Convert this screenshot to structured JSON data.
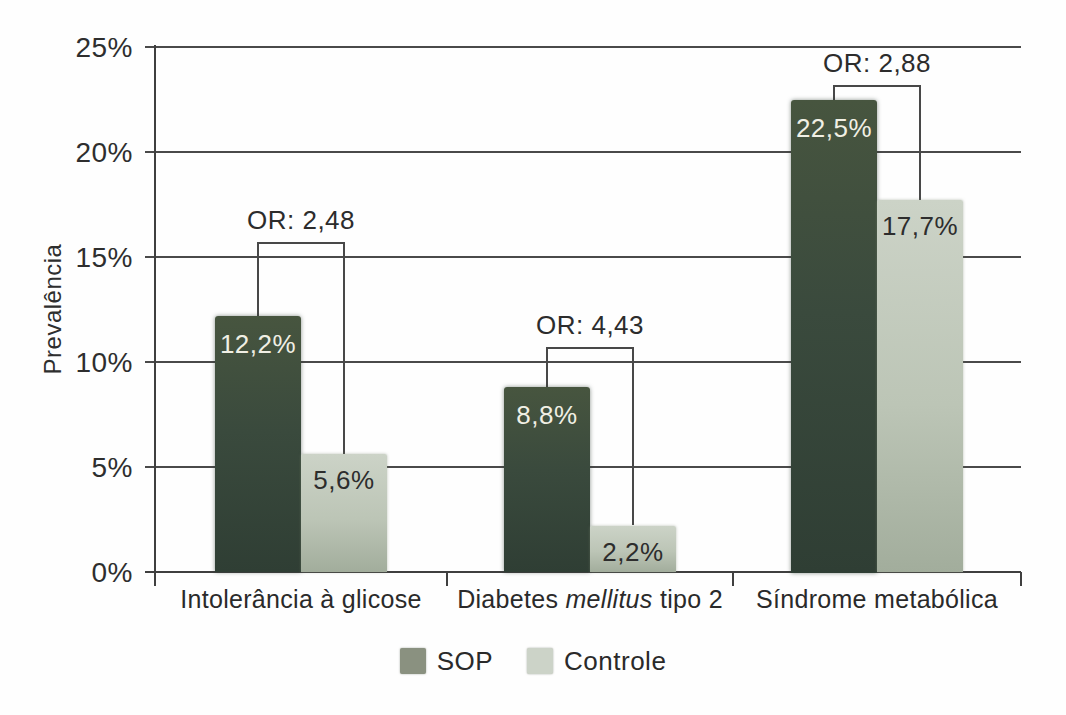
{
  "chart_data": {
    "type": "bar",
    "title": "",
    "xlabel": "",
    "ylabel": "Prevalência",
    "ylim": [
      0,
      25
    ],
    "grid": true,
    "legend_position": "bottom",
    "ytick_labels": [
      "25%",
      "20%",
      "15%",
      "10%",
      "5%",
      "0%"
    ],
    "ytick_values": [
      25,
      20,
      15,
      10,
      5,
      0
    ],
    "categories": [
      "Intolerância à glicose",
      "Diabetes mellitus tipo 2",
      "Síndrome metabólica"
    ],
    "category_italic_substrings": [
      "",
      "mellitus",
      ""
    ],
    "series": [
      {
        "name": "SOP",
        "values": [
          12.2,
          8.8,
          22.5
        ],
        "value_labels": [
          "12,2%",
          "8,8%",
          "22,5%"
        ],
        "color": "#3a4a3d",
        "legend_color": "#8a9180",
        "label_color": "#f0efe4"
      },
      {
        "name": "Controle",
        "values": [
          5.6,
          2.2,
          17.7
        ],
        "value_labels": [
          "5,6%",
          "2,2%",
          "17,7%"
        ],
        "color": "#bcc5b6",
        "legend_color": "#ccd3c8",
        "label_color": "#2d2d2d"
      }
    ],
    "annotations": [
      {
        "label": "OR: 2,48",
        "category_index": 0,
        "bracket_top_value": 15.7
      },
      {
        "label": "OR: 4,43",
        "category_index": 1,
        "bracket_top_value": 10.7
      },
      {
        "label": "OR: 2,88",
        "category_index": 2,
        "bracket_top_value": 23.2
      }
    ]
  }
}
